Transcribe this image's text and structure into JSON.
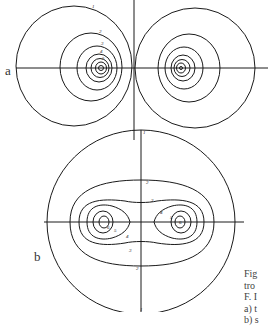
{
  "figure": {
    "panels": [
      {
        "label": "a",
        "contour_labels": [
          "1",
          "2",
          "3",
          "4",
          "5"
        ]
      },
      {
        "label": "b",
        "contour_labels": [
          "1",
          "2",
          "3",
          "4",
          "5",
          "6"
        ]
      }
    ],
    "caption_lines": [
      "Fig",
      "tro",
      "F. I",
      "a) t",
      "b) s"
    ]
  },
  "colors": {
    "line": "#1a1a1a",
    "text": "#444444",
    "background": "#ffffff"
  }
}
